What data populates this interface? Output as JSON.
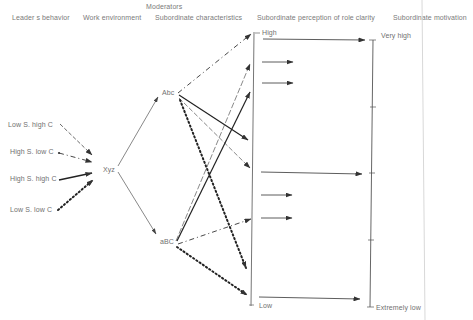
{
  "headers": {
    "group_label": "Moderators",
    "leader_behavior": "Leader s behavior",
    "work_environment": "Work environment",
    "subordinate_characteristics": "Subordinate characteristics",
    "role_clarity": "Subordinate perception of role clarity",
    "motivation": "Subordinate motivation"
  },
  "behaviors": [
    {
      "label": "Low S. high C",
      "line_style": "dashed"
    },
    {
      "label": "High S. low C",
      "line_style": "dash-dot"
    },
    {
      "label": "High S. high C",
      "line_style": "solid-bold"
    },
    {
      "label": "Low S. low C",
      "line_style": "dotted-bold"
    }
  ],
  "nodes": {
    "environment": "Xyz",
    "char_upper": "Abc",
    "char_lower": "aBC"
  },
  "role_clarity_scale": {
    "high": "High",
    "low": "Low"
  },
  "motivation_scale": {
    "high": "Very high",
    "low": "Extremely low"
  },
  "colors": {
    "line": "#333333",
    "text": "#707070",
    "background": "#ffffff"
  }
}
